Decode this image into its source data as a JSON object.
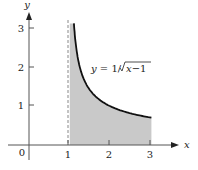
{
  "chart_data": {
    "type": "area",
    "title": "",
    "function": "y = 1/sqrt(x-1)",
    "curve_label": "y = 1/√x−1",
    "xlabel": "x",
    "ylabel": "y",
    "origin_label": "0",
    "xlim": [
      0,
      3.6
    ],
    "ylim": [
      0,
      3.5
    ],
    "x_ticks": [
      "1",
      "2",
      "3"
    ],
    "y_ticks": [
      "1",
      "2",
      "3"
    ],
    "shaded_region": {
      "x_from": 1,
      "x_to": 3,
      "color": "#c8c8c8"
    },
    "asymptote": {
      "x": 1,
      "style": "dashed"
    },
    "x": [
      1.1,
      1.25,
      1.5,
      2,
      2.5,
      3
    ],
    "values": [
      3.16,
      2.0,
      1.41,
      1.0,
      0.82,
      0.71
    ],
    "grid": false,
    "legend": "none"
  }
}
